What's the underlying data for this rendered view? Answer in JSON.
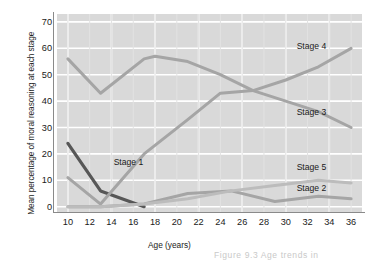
{
  "figure": {
    "ylabel": "Mean percentage of moral\nreasoning at each stage",
    "xlabel": "Age (years)",
    "caption": "Figure 9.3  Age trends in"
  },
  "chart_data": {
    "type": "line",
    "title": "",
    "xlabel": "Age (years)",
    "ylabel": "Mean percentage of moral reasoning at each stage",
    "xlim": [
      9,
      37
    ],
    "ylim": [
      -2,
      73
    ],
    "xticks": [
      10,
      12,
      14,
      16,
      18,
      20,
      22,
      24,
      26,
      28,
      30,
      32,
      34,
      36
    ],
    "yticks": [
      0,
      10,
      20,
      30,
      40,
      50,
      60,
      70
    ],
    "grid": true,
    "legend_position": "inline-end-labels",
    "plot_background": "#d9d9d9",
    "gridline_color": "#ffffff",
    "series": [
      {
        "name": "Stage 1",
        "color": "#575757",
        "label_x": 14.2,
        "label_y": 17,
        "x": [
          10,
          13,
          17
        ],
        "values": [
          24,
          6,
          0
        ]
      },
      {
        "name": "Stage 2",
        "color": "#a5a5a5",
        "label_x": 31.0,
        "label_y": 7,
        "x": [
          10,
          13,
          17,
          21,
          25,
          29,
          33,
          36
        ],
        "values": [
          0,
          0,
          1,
          5,
          6,
          2,
          4,
          3
        ]
      },
      {
        "name": "Stage 3",
        "color": "#a5a5a5",
        "label_x": 31.0,
        "label_y": 36,
        "x": [
          10,
          13,
          17,
          18,
          21,
          24,
          27,
          30,
          33,
          36
        ],
        "values": [
          56,
          43,
          56,
          57,
          55,
          50,
          44,
          40,
          36,
          30
        ]
      },
      {
        "name": "Stage 4",
        "color": "#a5a5a5",
        "label_x": 31.0,
        "label_y": 61,
        "x": [
          10,
          13,
          17,
          21,
          24,
          27,
          30,
          33,
          36
        ],
        "values": [
          11,
          1,
          20,
          33,
          43,
          44,
          48,
          53,
          60
        ]
      },
      {
        "name": "Stage 5",
        "color": "#bcbcbc",
        "label_x": 31.0,
        "label_y": 15,
        "x": [
          10,
          13,
          17,
          21,
          25,
          29,
          33,
          36
        ],
        "values": [
          0,
          0,
          1,
          3,
          6,
          8,
          10,
          9
        ]
      }
    ]
  }
}
